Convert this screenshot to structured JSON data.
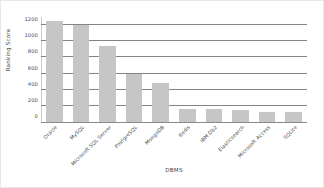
{
  "chart_data": {
    "type": "bar",
    "title": "",
    "xlabel": "DBMS",
    "ylabel": "Ranking Score",
    "categories": [
      "Oracle",
      "MySQL",
      "Microsoft SQL Server",
      "PostgreSQL",
      "MongoDB",
      "Redis",
      "IBM Db2",
      "Elasticsearch",
      "Microsoft Access",
      "SQLite"
    ],
    "values": [
      1250,
      1200,
      940,
      600,
      480,
      160,
      155,
      150,
      130,
      125
    ],
    "ylim": [
      0,
      1300
    ],
    "yticks": [
      0,
      200,
      400,
      600,
      800,
      1000,
      1200
    ],
    "ytick_labels": [
      "0",
      "200",
      "400",
      "600",
      "800",
      "1000",
      "1200"
    ],
    "grid": "horizontal",
    "legend": "none",
    "bar_color": "#c6c6c6",
    "gridline_color": "#6f6f6f",
    "background_color": "#ffffff"
  }
}
